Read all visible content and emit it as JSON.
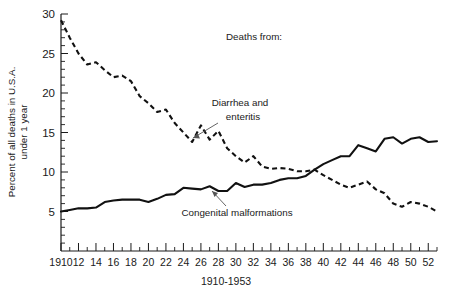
{
  "figure": {
    "legend_title": "Deaths from:",
    "xaxis_title": "1910-1953",
    "yaxis_title_line1": "Percent of all deaths in U.S.A.",
    "yaxis_title_line2": "under 1 year",
    "annotation_diarrhea_line1": "Diarrhea and",
    "annotation_diarrhea_line2": "enteritis",
    "annotation_congenital": "Congenital malformations",
    "ink_color": "#111111",
    "background_color": "#ffffff"
  },
  "chart_data": {
    "type": "line",
    "title": "",
    "subtitle": "",
    "xlabel": "1910-1953",
    "ylabel": "Percent of all deaths in U.S.A. under 1 year",
    "xlim": [
      1910,
      1953
    ],
    "ylim": [
      0,
      30
    ],
    "grid": false,
    "legend_position": "inline-annotations",
    "y_ticks_major": [
      5,
      10,
      15,
      20,
      25,
      30
    ],
    "y_ticks_minor_step": 1,
    "y_tick_labels": [
      "5",
      "10",
      "15",
      "20",
      "25",
      "30"
    ],
    "x_ticks_major": [
      1910,
      1912,
      1914,
      1916,
      1918,
      1920,
      1922,
      1924,
      1926,
      1928,
      1930,
      1932,
      1934,
      1936,
      1938,
      1940,
      1942,
      1944,
      1946,
      1948,
      1950,
      1952
    ],
    "x_tick_labels": [
      "1910",
      "12",
      "14",
      "16",
      "18",
      "20",
      "22",
      "24",
      "26",
      "28",
      "30",
      "32",
      "34",
      "36",
      "38",
      "40",
      "42",
      "44",
      "46",
      "48",
      "50",
      "52"
    ],
    "x_ticks_minor_step": 1,
    "x": [
      1910,
      1911,
      1912,
      1913,
      1914,
      1915,
      1916,
      1917,
      1918,
      1919,
      1920,
      1921,
      1922,
      1923,
      1924,
      1925,
      1926,
      1927,
      1928,
      1929,
      1930,
      1931,
      1932,
      1933,
      1934,
      1935,
      1936,
      1937,
      1938,
      1939,
      1940,
      1941,
      1942,
      1943,
      1944,
      1945,
      1946,
      1947,
      1948,
      1949,
      1950,
      1951,
      1952,
      1953
    ],
    "series": [
      {
        "name": "Diarrhea and enteritis",
        "style": "dashed",
        "values": [
          29.2,
          27.0,
          25.0,
          23.6,
          23.9,
          22.9,
          22.0,
          22.2,
          21.5,
          19.6,
          18.7,
          17.6,
          17.9,
          16.2,
          15.0,
          13.8,
          15.9,
          14.1,
          15.2,
          13.0,
          12.0,
          11.2,
          12.0,
          10.7,
          10.4,
          10.5,
          10.4,
          10.1,
          10.1,
          10.3,
          9.6,
          9.0,
          8.4,
          8.0,
          8.4,
          8.8,
          7.8,
          7.3,
          6.0,
          5.6,
          6.2,
          6.0,
          5.6,
          5.0
        ]
      },
      {
        "name": "Congenital malformations",
        "style": "solid",
        "values": [
          5.0,
          5.2,
          5.4,
          5.4,
          5.5,
          6.2,
          6.4,
          6.5,
          6.5,
          6.5,
          6.2,
          6.6,
          7.1,
          7.2,
          8.0,
          7.9,
          7.8,
          8.2,
          7.6,
          7.6,
          8.6,
          8.1,
          8.4,
          8.4,
          8.6,
          9.0,
          9.2,
          9.2,
          9.5,
          10.3,
          11.0,
          11.5,
          12.0,
          12.0,
          13.4,
          13.0,
          12.6,
          14.2,
          14.4,
          13.6,
          14.2,
          14.4,
          13.8,
          13.9
        ]
      }
    ]
  },
  "plot_geometry": {
    "left": 61,
    "right": 437,
    "top": 14,
    "bottom": 251
  }
}
